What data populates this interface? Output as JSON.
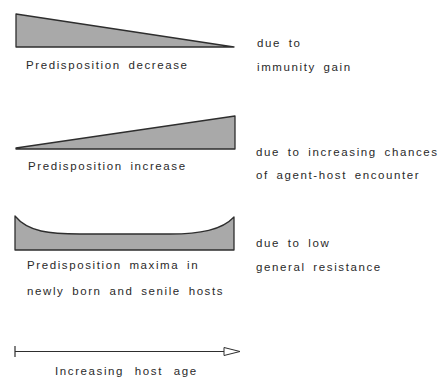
{
  "colors": {
    "fill": "#a9a9a9",
    "stroke": "#2e2e2e",
    "text": "#2a2a2a",
    "background": "#ffffff"
  },
  "panels": [
    {
      "shape": "decreasing-wedge",
      "label": "Predisposition decrease",
      "reason_lines": [
        "due to",
        "immunity gain"
      ]
    },
    {
      "shape": "increasing-wedge",
      "label": "Predisposition increase",
      "reason_lines": [
        "due to increasing chances",
        "of agent-host encounter"
      ]
    },
    {
      "shape": "u-shaped-band",
      "label_lines": [
        "Predisposition maxima in",
        "newly born and senile hosts"
      ],
      "reason_lines": [
        "due to low",
        "general resistance"
      ]
    }
  ],
  "axis": {
    "label": "Increasing host age",
    "direction": "left-to-right"
  }
}
